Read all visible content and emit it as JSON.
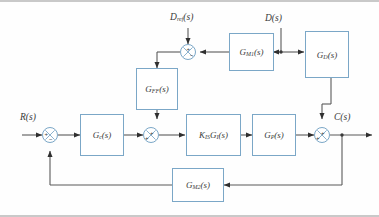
{
  "diagram": {
    "line_color": "#595959",
    "block_border_color": "#7ba7c7",
    "block_fill": "#ffffff",
    "text_color": "#3a3a3a",
    "frame_border_color": "#c9c9c9",
    "background": "#fefefe"
  },
  "signals": {
    "reference": "R(s)",
    "output": "C(s)",
    "disturbance": "D(s)",
    "disturbance_ref": "D",
    "disturbance_ref_sub": "ref",
    "disturbance_ref_tail": "(s)"
  },
  "blocks": [
    {
      "id": "gff",
      "name": "feedforward-block",
      "main": "G",
      "sub": "FF",
      "tail": "(s)"
    },
    {
      "id": "gc",
      "name": "controller-block",
      "main": "G",
      "sub": "c",
      "tail": "(s)"
    },
    {
      "id": "kigi",
      "name": "actuator-block",
      "main": "K",
      "sub": "IS",
      "main2": "G",
      "sub2": "I",
      "tail": "(s)"
    },
    {
      "id": "gp",
      "name": "process-block",
      "main": "G",
      "sub": "P",
      "tail": "(s)"
    },
    {
      "id": "gd",
      "name": "disturbance-dynamics-block",
      "main": "G",
      "sub": "D",
      "tail": "(s)"
    },
    {
      "id": "gm1",
      "name": "disturbance-measurement-block",
      "main": "G",
      "sub": "M1",
      "tail": "(s)"
    },
    {
      "id": "gm2",
      "name": "output-measurement-block",
      "main": "G",
      "sub": "M2",
      "tail": "(s)"
    }
  ],
  "summing_junctions": [
    {
      "id": "sum-error",
      "name": "error-summing-junction",
      "signs": {
        "left": "+",
        "bottom": "−"
      }
    },
    {
      "id": "sum-feedforward",
      "name": "feedforward-summing-junction",
      "signs": {
        "left": "+",
        "top": "+"
      }
    },
    {
      "id": "sum-top",
      "name": "disturbance-ref-summing-junction",
      "signs": {
        "top": "+",
        "right": "−"
      }
    },
    {
      "id": "sum-output",
      "name": "output-summing-junction",
      "signs": {
        "left": "+",
        "top": "+"
      }
    }
  ]
}
